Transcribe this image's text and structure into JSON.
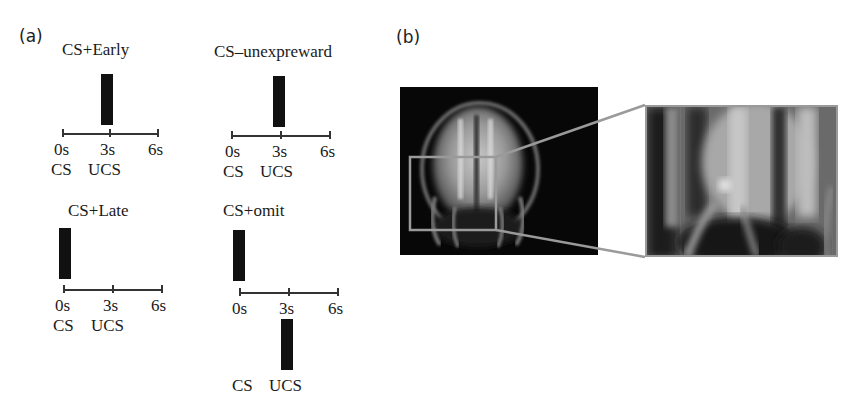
{
  "figure": {
    "panel_a": {
      "label": "(a)",
      "conditions": [
        {
          "title": "CS+Early",
          "ticks": [
            "0s",
            "3s",
            "6s"
          ],
          "events": [
            "CS",
            "UCS"
          ],
          "bar_time": "3s",
          "bar_position": "above-axis"
        },
        {
          "title": "CS–unexpreward",
          "ticks": [
            "0s",
            "3s",
            "6s"
          ],
          "events": [
            "CS",
            "UCS"
          ],
          "bar_time": "3s",
          "bar_position": "above-axis"
        },
        {
          "title": "CS+Late",
          "ticks": [
            "0s",
            "3s",
            "6s"
          ],
          "events": [
            "CS",
            "UCS"
          ],
          "bar_time": "0s",
          "bar_position": "above-axis"
        },
        {
          "title": "CS+omit",
          "ticks": [
            "0s",
            "3s",
            "6s"
          ],
          "events": [
            "CS",
            "UCS"
          ],
          "bar_time": "0s and 3s",
          "bar_position": "0s above-axis, 3s below-axis"
        }
      ]
    },
    "panel_b": {
      "label": "(b)",
      "image_description": "Coronal brain MRI slice with grey box highlighting a region, magnified inset to the right",
      "box_color": "#9a9a9a"
    }
  }
}
